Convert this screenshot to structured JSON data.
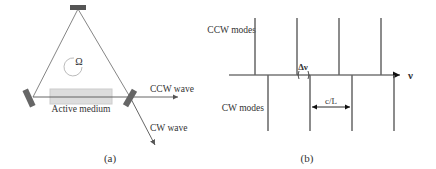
{
  "panel_a": {
    "caption": "(a)",
    "omega_symbol": "Ω",
    "medium_label": "Active medium",
    "ccw_label": "CCW wave",
    "cw_label": "CW wave"
  },
  "panel_b": {
    "caption": "(b)",
    "ccw_label": "CCW modes",
    "cw_label": "CW modes",
    "axis_label": "ν",
    "delta_label": "Δν",
    "spacing_label": "c/L"
  }
}
